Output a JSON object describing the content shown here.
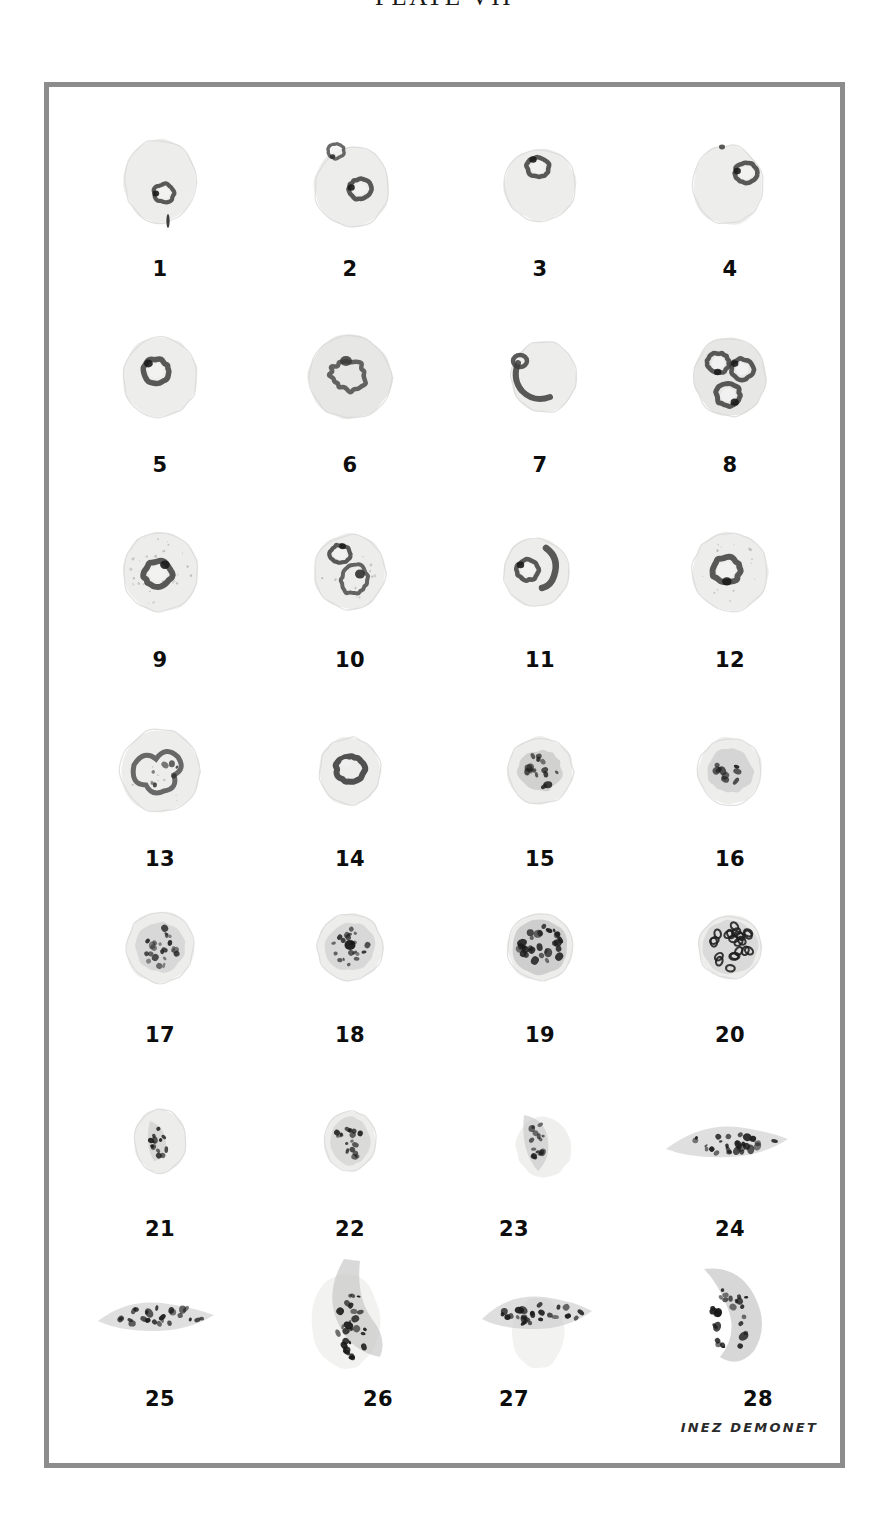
{
  "plate": {
    "title": "PLATE VII",
    "signature": "INEZ DEMONET",
    "frame_color": "#8c8c8c",
    "background_color": "#ffffff",
    "ink_color": "#0d0d0d"
  },
  "figures": [
    {
      "number": "1",
      "row": 0,
      "col": 0,
      "caption": "1",
      "stage": "early ring form in erythrocyte"
    },
    {
      "number": "2",
      "row": 0,
      "col": 1,
      "caption": "2",
      "stage": "two ring forms in erythrocyte"
    },
    {
      "number": "3",
      "row": 0,
      "col": 2,
      "caption": "3",
      "stage": "ring form in erythrocyte"
    },
    {
      "number": "4",
      "row": 0,
      "col": 3,
      "caption": "4",
      "stage": "marginal ring form (accole)"
    },
    {
      "number": "5",
      "row": 1,
      "col": 0,
      "caption": "5",
      "stage": "ring form with chromatin dot"
    },
    {
      "number": "6",
      "row": 1,
      "col": 1,
      "caption": "6",
      "stage": "ameboid trophozoite"
    },
    {
      "number": "7",
      "row": 1,
      "col": 2,
      "caption": "7",
      "stage": "elongated trophozoite at cell margin"
    },
    {
      "number": "8",
      "row": 1,
      "col": 3,
      "caption": "8",
      "stage": "multiple infection, three parasites"
    },
    {
      "number": "9",
      "row": 2,
      "col": 0,
      "caption": "9",
      "stage": "trophozoite with stippled cell"
    },
    {
      "number": "10",
      "row": 2,
      "col": 1,
      "caption": "10",
      "stage": "two trophozoites, one with pigment"
    },
    {
      "number": "11",
      "row": 2,
      "col": 2,
      "caption": "11",
      "stage": "ring and band form"
    },
    {
      "number": "12",
      "row": 2,
      "col": 3,
      "caption": "12",
      "stage": "ring form, enlarged pale cell"
    },
    {
      "number": "13",
      "row": 3,
      "col": 0,
      "caption": "13",
      "stage": "ameboid trophozoite, irregular"
    },
    {
      "number": "14",
      "row": 3,
      "col": 1,
      "caption": "14",
      "stage": "compact trophozoite with vacuole"
    },
    {
      "number": "15",
      "row": 3,
      "col": 2,
      "caption": "15",
      "stage": "late trophozoite with pigment"
    },
    {
      "number": "16",
      "row": 3,
      "col": 3,
      "caption": "16",
      "stage": "early schizont, two nuclei"
    },
    {
      "number": "17",
      "row": 4,
      "col": 0,
      "caption": "17",
      "stage": "developing schizont"
    },
    {
      "number": "18",
      "row": 4,
      "col": 1,
      "caption": "18",
      "stage": "schizont with central pigment mass"
    },
    {
      "number": "19",
      "row": 4,
      "col": 2,
      "caption": "19",
      "stage": "mature schizont, many merozoites"
    },
    {
      "number": "20",
      "row": 4,
      "col": 3,
      "caption": "20",
      "stage": "segmented schizont, merozoite rosette"
    },
    {
      "number": "21",
      "row": 5,
      "col": 0,
      "caption": "21",
      "stage": "immature gametocyte, oval"
    },
    {
      "number": "22",
      "row": 5,
      "col": 1,
      "caption": "22",
      "stage": "immature gametocyte, rounded"
    },
    {
      "number": "23",
      "row": 5,
      "col": 2,
      "caption": "23",
      "stage": "developing gametocyte in cell remnant"
    },
    {
      "number": "24",
      "row": 5,
      "col": 3,
      "caption": "24",
      "stage": "elongated crescent gametocyte"
    },
    {
      "number": "25",
      "row": 6,
      "col": 0,
      "caption": "25",
      "stage": "crescent gametocyte, pointed ends"
    },
    {
      "number": "26",
      "row": 6,
      "col": 1,
      "caption": "26",
      "stage": "curved macrogametocyte"
    },
    {
      "number": "27",
      "row": 6,
      "col": 2,
      "caption": "27",
      "stage": "broad gametocyte with host cell remnant"
    },
    {
      "number": "28",
      "row": 6,
      "col": 3,
      "caption": "28",
      "stage": "kidney-shaped macrogametocyte"
    }
  ]
}
